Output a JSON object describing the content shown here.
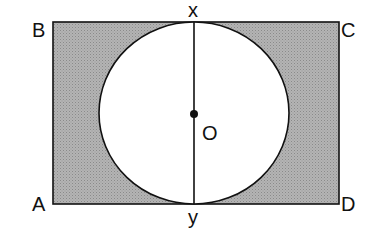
{
  "diagram": {
    "type": "geometry",
    "labels": {
      "B": "B",
      "C": "C",
      "A": "A",
      "D": "D",
      "x": "x",
      "y": "y",
      "O": "O"
    },
    "colors": {
      "shade": "#a8a8a8",
      "stroke": "#111111",
      "background": "#ffffff"
    }
  }
}
